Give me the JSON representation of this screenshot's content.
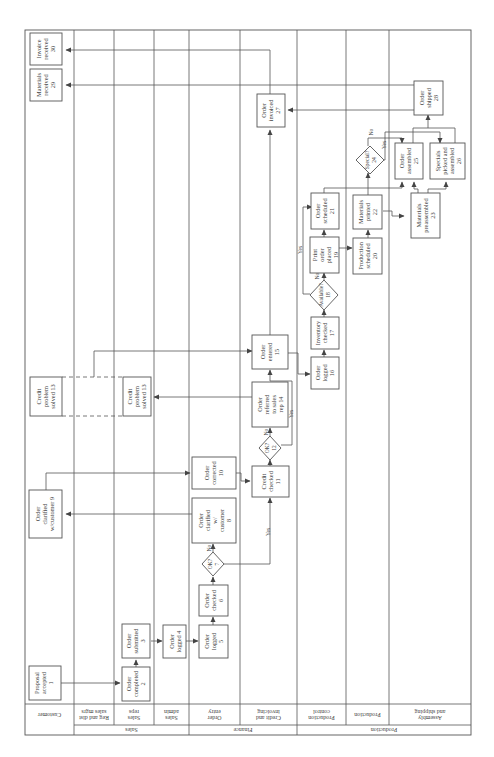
{
  "diagram": {
    "type": "cross-functional swimlane flowchart (rotated)",
    "groups": [
      {
        "id": "sales",
        "label": "Sales"
      },
      {
        "id": "finance",
        "label": "Finance"
      },
      {
        "id": "production",
        "label": "Production"
      }
    ],
    "lanes": [
      {
        "id": "customer",
        "label": "Customer",
        "group": null
      },
      {
        "id": "reg_dist_mgrs",
        "label": "Reg and dist\nsales mgrs",
        "label_l1": "Reg and dist",
        "label_l2": "sales mgrs",
        "group": "sales"
      },
      {
        "id": "sales_reps",
        "label": "Sales\nreps",
        "label_l1": "Sales",
        "label_l2": "reps",
        "group": "sales"
      },
      {
        "id": "sales_admin",
        "label": "Sales\nadmin",
        "label_l1": "Sales",
        "label_l2": "admin",
        "group": "sales"
      },
      {
        "id": "order_entry",
        "label": "Order\nentry",
        "label_l1": "Order",
        "label_l2": "entry",
        "group": "finance"
      },
      {
        "id": "credit_invoicing",
        "label": "Credit and\ninvoicing",
        "label_l1": "Credit and",
        "label_l2": "invoicing",
        "group": "finance"
      },
      {
        "id": "production_control",
        "label": "Production\ncontrol",
        "label_l1": "Production",
        "label_l2": "control",
        "group": "production"
      },
      {
        "id": "production",
        "label": "Production",
        "group": "production"
      },
      {
        "id": "assembly_shipping",
        "label": "Assembly\nand shipping",
        "label_l1": "Assembly",
        "label_l2": "and shipping",
        "group": "production"
      }
    ],
    "nodes": [
      {
        "id": 1,
        "shape": "box",
        "lane": "customer",
        "lines": [
          "Proposal",
          "accepted",
          "1"
        ]
      },
      {
        "id": 2,
        "shape": "box",
        "lane": "sales_reps",
        "lines": [
          "Order",
          "completed",
          "2"
        ]
      },
      {
        "id": 3,
        "shape": "box",
        "lane": "sales_reps",
        "lines": [
          "Order",
          "submitted",
          "3"
        ]
      },
      {
        "id": 4,
        "shape": "box",
        "lane": "sales_admin",
        "lines": [
          "Order",
          "logged 4"
        ]
      },
      {
        "id": 5,
        "shape": "box",
        "lane": "order_entry",
        "lines": [
          "Order",
          "logged",
          "5"
        ]
      },
      {
        "id": 6,
        "shape": "box",
        "lane": "order_entry",
        "lines": [
          "Order",
          "checked",
          "6"
        ]
      },
      {
        "id": 7,
        "shape": "diamond",
        "lane": "order_entry",
        "lines": [
          "OK?",
          "7"
        ]
      },
      {
        "id": 8,
        "shape": "box",
        "lane": "order_entry",
        "lines": [
          "Order",
          "clarified",
          "w/",
          "customer",
          "8"
        ]
      },
      {
        "id": 9,
        "shape": "box",
        "lane": "customer",
        "lines": [
          "Order",
          "clarified",
          "w/customer 9"
        ]
      },
      {
        "id": 10,
        "shape": "box",
        "lane": "order_entry",
        "lines": [
          "Order",
          "corrected",
          "10"
        ]
      },
      {
        "id": 11,
        "shape": "box",
        "lane": "credit_invoicing",
        "lines": [
          "Credit",
          "checked",
          "11"
        ]
      },
      {
        "id": 12,
        "shape": "diamond",
        "lane": "credit_invoicing",
        "lines": [
          "OK?",
          "12"
        ]
      },
      {
        "id": 14,
        "shape": "box",
        "lane": "credit_invoicing",
        "lines": [
          "Order",
          "referred",
          "to sales",
          "rep 14"
        ]
      },
      {
        "id": "13a",
        "shape": "box",
        "lane": "sales_reps",
        "lines": [
          "Credit",
          "problem",
          "solved 13"
        ]
      },
      {
        "id": "13b",
        "shape": "box",
        "lane": "customer",
        "lines": [
          "Credit",
          "problem",
          "solved 13"
        ]
      },
      {
        "id": 15,
        "shape": "box",
        "lane": "credit_invoicing",
        "lines": [
          "Order",
          "entered",
          "15"
        ]
      },
      {
        "id": 16,
        "shape": "box",
        "lane": "production_control",
        "lines": [
          "Order",
          "logged",
          "16"
        ]
      },
      {
        "id": 17,
        "shape": "box",
        "lane": "production_control",
        "lines": [
          "Inventory",
          "checked",
          "17"
        ]
      },
      {
        "id": 18,
        "shape": "diamond",
        "lane": "production_control",
        "lines": [
          "Available?",
          "18"
        ]
      },
      {
        "id": 19,
        "shape": "box",
        "lane": "production_control",
        "lines": [
          "Print",
          "order",
          "placed",
          "19"
        ]
      },
      {
        "id": 20,
        "shape": "box",
        "lane": "production",
        "lines": [
          "Production",
          "scheduled",
          "20"
        ]
      },
      {
        "id": 21,
        "shape": "box",
        "lane": "production_control",
        "lines": [
          "Order",
          "scheduled",
          "21"
        ]
      },
      {
        "id": 22,
        "shape": "box",
        "lane": "production",
        "lines": [
          "Materials",
          "printed",
          "22"
        ]
      },
      {
        "id": 23,
        "shape": "box",
        "lane": "assembly_shipping",
        "lines": [
          "Materials",
          "preassembled",
          "23"
        ]
      },
      {
        "id": 24,
        "shape": "diamond",
        "lane": "production",
        "lines": [
          "Special?",
          "24"
        ]
      },
      {
        "id": 25,
        "shape": "box",
        "lane": "assembly_shipping",
        "lines": [
          "Order",
          "assembled",
          "25"
        ]
      },
      {
        "id": 26,
        "shape": "box",
        "lane": "assembly_shipping",
        "lines": [
          "Specials",
          "picked and",
          "assembled",
          "26"
        ]
      },
      {
        "id": 27,
        "shape": "box",
        "lane": "credit_invoicing",
        "lines": [
          "Order",
          "invoiced",
          "27"
        ]
      },
      {
        "id": 28,
        "shape": "box",
        "lane": "assembly_shipping",
        "lines": [
          "Order",
          "shipped",
          "28"
        ]
      },
      {
        "id": 29,
        "shape": "box",
        "lane": "customer",
        "lines": [
          "Materials",
          "received",
          "29"
        ]
      },
      {
        "id": 30,
        "shape": "box",
        "lane": "customer",
        "lines": [
          "Invoice",
          "received",
          "30"
        ]
      }
    ],
    "edge_labels": {
      "no": "No",
      "yes": "Yes"
    },
    "edges": [
      {
        "from": 1,
        "to": 2
      },
      {
        "from": 2,
        "to": 3
      },
      {
        "from": 3,
        "to": 4
      },
      {
        "from": 4,
        "to": 5
      },
      {
        "from": 5,
        "to": 6
      },
      {
        "from": 6,
        "to": 7
      },
      {
        "from": 7,
        "to": 8,
        "label": "No"
      },
      {
        "from": 7,
        "to": 11,
        "label": "Yes"
      },
      {
        "from": 8,
        "to": 9
      },
      {
        "from": 9,
        "to": 10
      },
      {
        "from": 10,
        "to": 11
      },
      {
        "from": 11,
        "to": 12
      },
      {
        "from": 12,
        "to": 14,
        "label": "No"
      },
      {
        "from": 12,
        "to": 15,
        "label": "Yes"
      },
      {
        "from": 14,
        "to": "13a"
      },
      {
        "from": "13a",
        "to": 15,
        "style": "linked to 13b (dashed)"
      },
      {
        "from": 15,
        "to": 16
      },
      {
        "from": 16,
        "to": 17
      },
      {
        "from": 17,
        "to": 18
      },
      {
        "from": 18,
        "to": 19,
        "label": "No"
      },
      {
        "from": 18,
        "to": 21,
        "label": "Yes"
      },
      {
        "from": 19,
        "to": 21
      },
      {
        "from": 19,
        "to": 20
      },
      {
        "from": 20,
        "to": 22
      },
      {
        "from": 22,
        "to": 23
      },
      {
        "from": 22,
        "to": 24
      },
      {
        "from": 22,
        "to": 25
      },
      {
        "from": 24,
        "to": 25,
        "label": "No"
      },
      {
        "from": 24,
        "to": 26,
        "label": "Yes"
      },
      {
        "from": 23,
        "to": 25
      },
      {
        "from": 23,
        "to": 26
      },
      {
        "from": 25,
        "to": 28
      },
      {
        "from": 26,
        "to": 28
      },
      {
        "from": 28,
        "to": 27
      },
      {
        "from": 28,
        "to": 29
      },
      {
        "from": 27,
        "to": 30
      }
    ]
  }
}
